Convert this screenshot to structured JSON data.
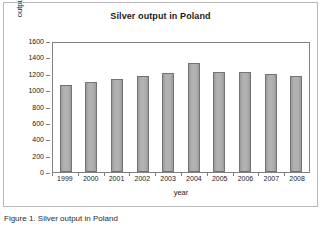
{
  "figure": {
    "title": "Silver output in Poland",
    "caption": "Figure 1. Silver output in Poland"
  },
  "chart_data": {
    "type": "bar",
    "title": "Silver output in Poland",
    "xlabel": "year",
    "ylabel": "output (Mg)",
    "categories": [
      "1999",
      "2000",
      "2001",
      "2002",
      "2003",
      "2004",
      "2005",
      "2006",
      "2007",
      "2008"
    ],
    "values": [
      1085,
      1120,
      1155,
      1195,
      1225,
      1350,
      1245,
      1245,
      1215,
      1190
    ],
    "ylim": [
      0,
      1600
    ],
    "yticks": [
      0,
      200,
      400,
      600,
      800,
      1000,
      1200,
      1400,
      1600
    ],
    "ytick_labels": [
      "0",
      "200",
      "400",
      "600",
      "800",
      "1000",
      "1200",
      "1400",
      "1600"
    ],
    "grid": false,
    "legend": false,
    "bar_color": "#a9a9a9",
    "bar_border_color": "#737373",
    "axis_color": "#808080",
    "text_color": "#1a1a1a"
  }
}
